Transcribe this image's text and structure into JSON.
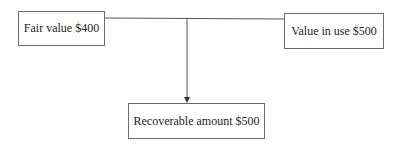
{
  "diagram": {
    "nodes": {
      "fair_value": {
        "label": "Fair value $400"
      },
      "value_in_use": {
        "label": "Value in use $500"
      },
      "recoverable_amount": {
        "label": "Recoverable amount $500"
      }
    },
    "edges": [
      {
        "from": "fair_value",
        "to": "value_in_use",
        "type": "line"
      },
      {
        "from": "connector",
        "to": "recoverable_amount",
        "type": "arrow"
      }
    ],
    "colors": {
      "line": "#555555",
      "border": "#6b6b6b",
      "text": "#222222"
    }
  }
}
